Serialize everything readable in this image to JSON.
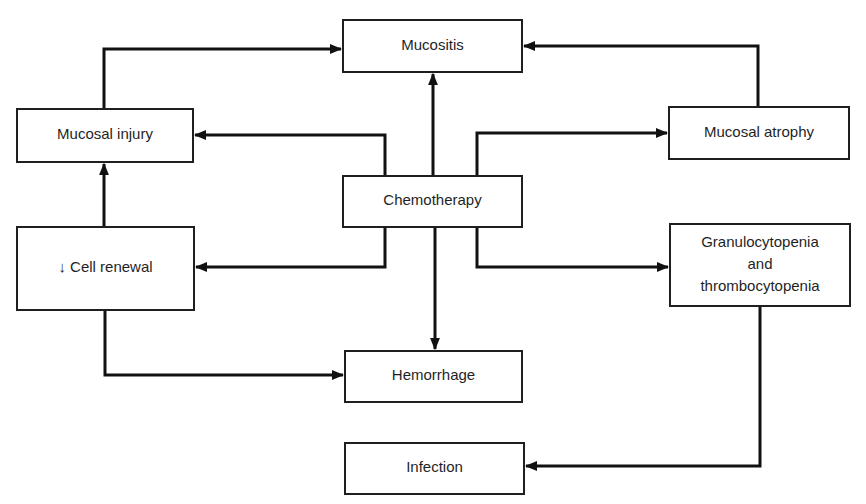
{
  "diagram": {
    "line_color": "#111111",
    "box_border_color": "#1f1f1f",
    "background": "#ffffff",
    "nodes": [
      {
        "id": "mucositis",
        "lines": [
          "Mucositis"
        ]
      },
      {
        "id": "mucosal-injury",
        "lines": [
          "Mucosal injury"
        ]
      },
      {
        "id": "mucosal-atrophy",
        "lines": [
          "Mucosal atrophy"
        ]
      },
      {
        "id": "chemotherapy",
        "lines": [
          "Chemotherapy"
        ]
      },
      {
        "id": "cell-renewal",
        "lines": [
          "↓ Cell renewal"
        ]
      },
      {
        "id": "granulocytopenia",
        "lines": [
          "Granulocytopenia",
          "and",
          "thrombocytopenia"
        ]
      },
      {
        "id": "hemorrhage",
        "lines": [
          "Hemorrhage"
        ]
      },
      {
        "id": "infection",
        "lines": [
          "Infection"
        ]
      }
    ],
    "edges": [
      {
        "from": "mucosal-injury",
        "to": "mucositis"
      },
      {
        "from": "mucosal-atrophy",
        "to": "mucositis"
      },
      {
        "from": "chemotherapy",
        "to": "mucositis"
      },
      {
        "from": "chemotherapy",
        "to": "mucosal-injury"
      },
      {
        "from": "chemotherapy",
        "to": "mucosal-atrophy"
      },
      {
        "from": "chemotherapy",
        "to": "cell-renewal"
      },
      {
        "from": "chemotherapy",
        "to": "granulocytopenia"
      },
      {
        "from": "chemotherapy",
        "to": "hemorrhage"
      },
      {
        "from": "cell-renewal",
        "to": "mucosal-injury"
      },
      {
        "from": "cell-renewal",
        "to": "hemorrhage"
      },
      {
        "from": "granulocytopenia",
        "to": "infection"
      }
    ]
  }
}
